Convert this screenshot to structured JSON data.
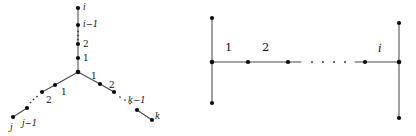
{
  "figure": {
    "caption": "",
    "background_color": "#ffffff",
    "edge_color": "#4a4a4a",
    "vertex_color": "#0c0c0c"
  },
  "left_diagram": {
    "name": "spider-tree",
    "description": "Three-legged spider (star-like) tree with a central branch vertex",
    "center_vertex_label": "",
    "branches": [
      {
        "name": "up-branch",
        "direction": "up",
        "labels": [
          "1",
          "2",
          "i−1",
          "i"
        ],
        "ellipsis": "⋮"
      },
      {
        "name": "lower-left-branch",
        "direction": "down-left",
        "labels": [
          "1",
          "2",
          "j−1",
          "j"
        ],
        "ellipsis": "· · ·"
      },
      {
        "name": "lower-right-branch",
        "direction": "down-right",
        "labels": [
          "1",
          "2",
          "k−1",
          "k"
        ],
        "ellipsis": "· · ·"
      }
    ],
    "labels": {
      "up_1": "1",
      "up_2": "2",
      "up_i_minus_1": "i−1",
      "up_i": "i",
      "left_1": "1",
      "left_2": "2",
      "left_j_minus_1": "j−1",
      "left_j": "j",
      "right_1": "1",
      "right_2": "2",
      "right_k_minus_1": "k−1",
      "right_k": "k"
    }
  },
  "right_diagram": {
    "name": "h-shape-caterpillar",
    "description": "Horizontal spine with vertical two-leaf bars attached at each end",
    "spine_labels": [
      "1",
      "2",
      "i"
    ],
    "ellipsis": "·  ·  ·  ·",
    "labels": {
      "edge_1": "1",
      "edge_2": "2",
      "edge_i": "i"
    }
  }
}
